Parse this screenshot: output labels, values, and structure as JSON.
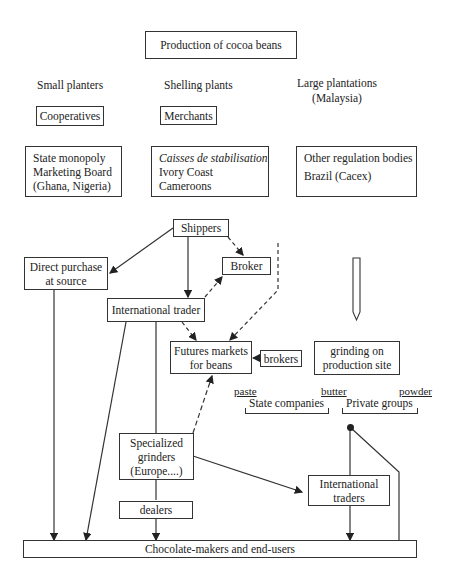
{
  "diagram": {
    "top": {
      "production": "Production of cocoa beans"
    },
    "producers": {
      "small_planters": "Small planters",
      "shelling_plants": "Shelling plants",
      "large_plantations_line1": "Large plantations",
      "large_plantations_line2": "(Malaysia)"
    },
    "intermediaries": {
      "cooperatives": "Cooperatives",
      "merchants": "Merchants"
    },
    "regulation": {
      "state_monopoly": [
        "State monopoly",
        "Marketing Board",
        "(Ghana, Nigeria)"
      ],
      "caisses": [
        "Caisses de stabilisation",
        "Ivory Coast",
        "Cameroons"
      ],
      "other": [
        "Other regulation bodies",
        "Brazil (Cacex)"
      ]
    },
    "flow": {
      "shippers": "Shippers",
      "direct_purchase": [
        "Direct purchase",
        "at source"
      ],
      "broker": "Broker",
      "international_trader": "International trader",
      "futures_markets": [
        "Futures markets",
        "for beans"
      ],
      "brokers": "brokers",
      "grinding": [
        "grinding on",
        "production site"
      ],
      "products": {
        "paste": "paste",
        "butter": "butter",
        "powder": "powder"
      },
      "groups": {
        "state_companies": "State companies",
        "private_groups": "Private groups"
      },
      "specialized_grinders": [
        "Specialized",
        "grinders",
        "(Europe....)"
      ],
      "dealers": "dealers",
      "international_traders": [
        "International",
        "traders"
      ],
      "end_users": "Chocolate-makers and end-users"
    }
  }
}
